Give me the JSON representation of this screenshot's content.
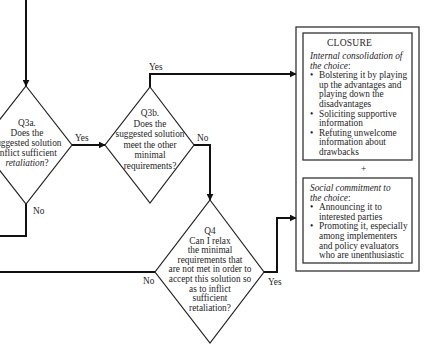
{
  "diagram": {
    "colors": {
      "line": "#111111",
      "box_border": "#333333",
      "text": "#1e1e1e",
      "background": "#ffffff"
    },
    "nodes": {
      "q3a": {
        "lines": [
          "Q3a.",
          "Does the",
          "suggested solution",
          "inflict sufficient"
        ],
        "last_line_italic": "retaliation",
        "last_line_suffix": "?"
      },
      "q3b": {
        "lines": [
          "Q3b.",
          "Does the",
          "suggested solution",
          "meet the other",
          "minimal",
          "requirements?"
        ]
      },
      "q4": {
        "lines": [
          "Q4",
          "Can I relax",
          "the minimal",
          "requirements that",
          "are not met in order to",
          "accept this solution so",
          "as to inflict",
          "sufficient",
          "retaliation?"
        ]
      }
    },
    "edges": {
      "q3a_yes": "Yes",
      "q3a_no": "No",
      "q3b_yes": "Yes",
      "q3b_no": "No",
      "q4_yes": "Yes",
      "q4_no": "No"
    },
    "closure": {
      "title": "CLOSURE",
      "internal": {
        "heading_line1": "Internal consolidation of",
        "heading_line2": "the choice",
        "heading_suffix": ":",
        "bullets": [
          [
            "Bolstering it by playing",
            "up the advantages and",
            "playing down the",
            "disadvantages"
          ],
          [
            "Soliciting supportive",
            "information"
          ],
          [
            "Refuting unwelcome",
            "information about",
            "drawbacks"
          ]
        ]
      },
      "plus": "+",
      "social": {
        "heading_line1": "Social commitment to",
        "heading_line2": "the choice",
        "heading_suffix": ":",
        "bullets": [
          [
            "Announcing it to",
            "interested parties"
          ],
          [
            "Promoting it, especially",
            "among implementers",
            "and policy evaluators",
            "who are unenthusiastic"
          ]
        ]
      },
      "bullet_glyph": "•"
    }
  }
}
